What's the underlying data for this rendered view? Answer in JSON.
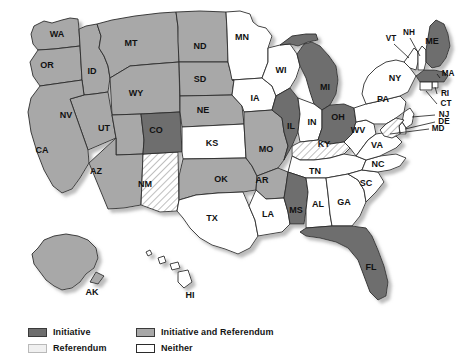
{
  "map": {
    "title": "State Initiative and Referendum Processes",
    "colors": {
      "initiative": "#6e6e6e",
      "initiative_and_referendum": "#a8a8a8",
      "referendum": "#f0f0f0",
      "neither": "#ffffff",
      "border": "#2b2b2b",
      "shadow": "#c9c9c9",
      "label_text": "#111111"
    },
    "legend": {
      "items": [
        {
          "label": "Initiative",
          "category": "initiative",
          "swatch": "#6e6e6e",
          "pattern": "solid"
        },
        {
          "label": "Initiative and Referendum",
          "category": "initiative_and_referendum",
          "swatch": "#a8a8a8",
          "pattern": "solid"
        },
        {
          "label": "Referendum",
          "category": "referendum",
          "swatch": "#f0f0f0",
          "pattern": "hatch"
        },
        {
          "label": "Neither",
          "category": "neither",
          "swatch": "#ffffff",
          "pattern": "solid"
        }
      ]
    },
    "states": [
      {
        "code": "WA",
        "category": "initiative_and_referendum",
        "label_x": 57,
        "label_y": 35
      },
      {
        "code": "OR",
        "category": "initiative_and_referendum",
        "label_x": 47,
        "label_y": 66
      },
      {
        "code": "ID",
        "category": "initiative_and_referendum",
        "label_x": 92,
        "label_y": 72
      },
      {
        "code": "MT",
        "category": "initiative_and_referendum",
        "label_x": 131,
        "label_y": 44
      },
      {
        "code": "WY",
        "category": "initiative_and_referendum",
        "label_x": 136,
        "label_y": 94
      },
      {
        "code": "NV",
        "category": "initiative_and_referendum",
        "label_x": 66,
        "label_y": 116
      },
      {
        "code": "UT",
        "category": "initiative_and_referendum",
        "label_x": 104,
        "label_y": 129
      },
      {
        "code": "CA",
        "category": "initiative_and_referendum",
        "label_x": 42,
        "label_y": 151
      },
      {
        "code": "AZ",
        "category": "initiative_and_referendum",
        "label_x": 96,
        "label_y": 172
      },
      {
        "code": "ND",
        "category": "initiative_and_referendum",
        "label_x": 200,
        "label_y": 47
      },
      {
        "code": "SD",
        "category": "initiative_and_referendum",
        "label_x": 200,
        "label_y": 80
      },
      {
        "code": "NE",
        "category": "initiative_and_referendum",
        "label_x": 203,
        "label_y": 111
      },
      {
        "code": "MO",
        "category": "initiative_and_referendum",
        "label_x": 266,
        "label_y": 150
      },
      {
        "code": "OK",
        "category": "initiative_and_referendum",
        "label_x": 221,
        "label_y": 180
      },
      {
        "code": "AR",
        "category": "initiative_and_referendum",
        "label_x": 262,
        "label_y": 181
      },
      {
        "code": "AK",
        "category": "initiative_and_referendum",
        "label_x": 92,
        "label_y": 293
      },
      {
        "code": "CO",
        "category": "initiative",
        "label_x": 156,
        "label_y": 131
      },
      {
        "code": "IL",
        "category": "initiative",
        "label_x": 291,
        "label_y": 127
      },
      {
        "code": "MI",
        "category": "initiative",
        "label_x": 325,
        "label_y": 88
      },
      {
        "code": "OH",
        "category": "initiative",
        "label_x": 338,
        "label_y": 118
      },
      {
        "code": "ME",
        "category": "initiative",
        "label_x": 432,
        "label_y": 42
      },
      {
        "code": "MA",
        "category": "initiative",
        "label_x": 448,
        "label_y": 74
      },
      {
        "code": "MS",
        "category": "initiative",
        "label_x": 296,
        "label_y": 211
      },
      {
        "code": "FL",
        "category": "initiative",
        "label_x": 371,
        "label_y": 268
      },
      {
        "code": "NM",
        "category": "referendum",
        "label_x": 145,
        "label_y": 185
      },
      {
        "code": "KY",
        "category": "referendum",
        "label_x": 324,
        "label_y": 145
      },
      {
        "code": "MD",
        "category": "referendum",
        "label_x": 438,
        "label_y": 129
      },
      {
        "code": "MN",
        "category": "neither",
        "label_x": 242,
        "label_y": 38
      },
      {
        "code": "WI",
        "category": "neither",
        "label_x": 281,
        "label_y": 71
      },
      {
        "code": "IA",
        "category": "neither",
        "label_x": 255,
        "label_y": 99
      },
      {
        "code": "KS",
        "category": "neither",
        "label_x": 212,
        "label_y": 144
      },
      {
        "code": "TX",
        "category": "neither",
        "label_x": 212,
        "label_y": 219
      },
      {
        "code": "LA",
        "category": "neither",
        "label_x": 268,
        "label_y": 215
      },
      {
        "code": "AL",
        "category": "neither",
        "label_x": 318,
        "label_y": 205
      },
      {
        "code": "GA",
        "category": "neither",
        "label_x": 344,
        "label_y": 203
      },
      {
        "code": "SC",
        "category": "neither",
        "label_x": 366,
        "label_y": 184
      },
      {
        "code": "NC",
        "category": "neither",
        "label_x": 378,
        "label_y": 165
      },
      {
        "code": "TN",
        "category": "neither",
        "label_x": 315,
        "label_y": 172
      },
      {
        "code": "IN",
        "category": "neither",
        "label_x": 312,
        "label_y": 123
      },
      {
        "code": "WV",
        "category": "neither",
        "label_x": 358,
        "label_y": 131
      },
      {
        "code": "VA",
        "category": "neither",
        "label_x": 377,
        "label_y": 146
      },
      {
        "code": "PA",
        "category": "neither",
        "label_x": 383,
        "label_y": 100
      },
      {
        "code": "NY",
        "category": "neither",
        "label_x": 395,
        "label_y": 79
      },
      {
        "code": "VT",
        "category": "neither",
        "label_x": 391,
        "label_y": 39
      },
      {
        "code": "NH",
        "category": "neither",
        "label_x": 409,
        "label_y": 33
      },
      {
        "code": "RI",
        "category": "neither",
        "label_x": 445,
        "label_y": 94
      },
      {
        "code": "CT",
        "category": "neither",
        "label_x": 446,
        "label_y": 104
      },
      {
        "code": "NJ",
        "category": "neither",
        "label_x": 444,
        "label_y": 115
      },
      {
        "code": "DE",
        "category": "neither",
        "label_x": 444,
        "label_y": 122
      },
      {
        "code": "HI",
        "category": "neither",
        "label_x": 190,
        "label_y": 296
      }
    ]
  }
}
